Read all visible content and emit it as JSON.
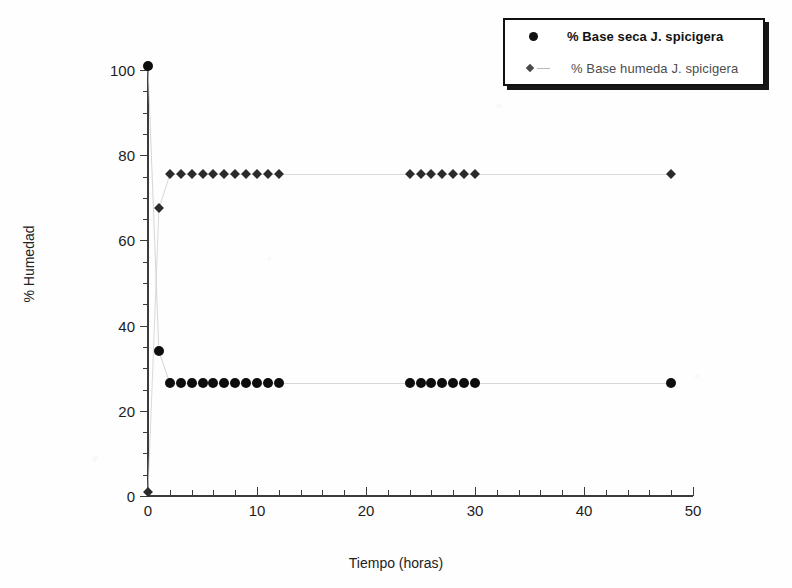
{
  "chart_data": {
    "type": "scatter",
    "title": "",
    "xlabel": "Tiempo (horas)",
    "ylabel": "% Humedad",
    "xlim": [
      0,
      50
    ],
    "ylim": [
      0,
      100
    ],
    "xticks": [
      0,
      10,
      20,
      30,
      40,
      50
    ],
    "yticks": [
      0,
      20,
      40,
      60,
      80,
      100
    ],
    "xtick_minor_step": 2,
    "ytick_minor_step": 5,
    "grid": false,
    "legend_position": "top-right",
    "series": [
      {
        "name": "% Base seca J. spicigera",
        "marker": "circle",
        "color": "#0d0d0d",
        "x": [
          0,
          1,
          2,
          3,
          4,
          5,
          6,
          7,
          8,
          9,
          10,
          11,
          12,
          24,
          25,
          26,
          27,
          28,
          29,
          30,
          48
        ],
        "y": [
          101.0,
          34.0,
          26.5,
          26.5,
          26.5,
          26.5,
          26.5,
          26.5,
          26.5,
          26.5,
          26.5,
          26.5,
          26.5,
          26.5,
          26.5,
          26.5,
          26.5,
          26.5,
          26.5,
          26.5,
          26.5
        ]
      },
      {
        "name": "% Base humeda J. spicigera",
        "marker": "diamond",
        "color": "#2b2b2b",
        "x": [
          0,
          1,
          2,
          3,
          4,
          5,
          6,
          7,
          8,
          9,
          10,
          11,
          12,
          24,
          25,
          26,
          27,
          28,
          29,
          30,
          48
        ],
        "y": [
          1.0,
          67.5,
          75.5,
          75.5,
          75.5,
          75.5,
          75.5,
          75.5,
          75.5,
          75.5,
          75.5,
          75.5,
          75.5,
          75.5,
          75.5,
          75.5,
          75.5,
          75.5,
          75.5,
          75.5,
          75.5
        ]
      }
    ]
  },
  "legend": {
    "entries": [
      {
        "label": "% Base seca J. spicigera",
        "marker": "circle"
      },
      {
        "label": "% Base humeda J. spicigera",
        "marker": "diamond"
      }
    ]
  },
  "axes": {
    "y_title": "% Humedad",
    "x_title": "Tiempo (horas)",
    "y_labels": [
      "0",
      "20",
      "40",
      "60",
      "80",
      "100"
    ],
    "x_labels": [
      "0",
      "10",
      "20",
      "30",
      "40",
      "50"
    ]
  }
}
